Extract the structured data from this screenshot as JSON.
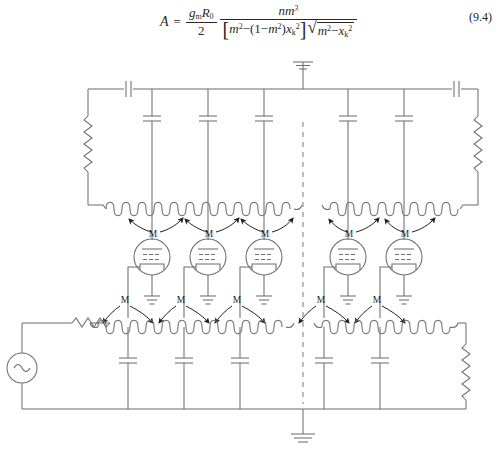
{
  "equation": {
    "lhs": "A",
    "equals": "=",
    "prefactor": {
      "numerator": "g<sub>m</sub>R<sub>0</sub>",
      "denominator": "2",
      "num_plain": "gmR0",
      "den_plain": "2"
    },
    "main_numerator": "nm³",
    "main_denominator_bracket": "[ m² − (1 − m²)xₖ² ]",
    "main_denominator_radical": "√( m² − xₖ² )",
    "number": "(9.4)",
    "parts": {
      "g": "g",
      "g_sub": "m",
      "R": "R",
      "R_sub": "0",
      "two": "2",
      "n": "n",
      "m": "m",
      "m_sup": "3",
      "bracket_open": "[",
      "bracket_close": "]",
      "m1": "m",
      "m1_sup": "2",
      "minus": "−",
      "paren_open": "(",
      "one": "1",
      "minus2": "−",
      "m2": "m",
      "m2_sup": "2",
      "paren_close": ")",
      "x": "x",
      "x_sub": "k",
      "x_sup": "2",
      "radical": "√",
      "m3": "m",
      "m3_sup": "2",
      "minus3": "−",
      "x2": "x",
      "x2_sub": "k",
      "x2_sup": "2"
    }
  },
  "circuit": {
    "title": "distributed-amplifier travelling-wave circuit",
    "labels": {
      "mutual_inductance": "M"
    },
    "mutual_coupling_labels": [
      "M",
      "M",
      "M",
      "M",
      "M",
      "M",
      "M",
      "M",
      "M",
      "M"
    ],
    "components": {
      "ac_source_symbol": "∼",
      "ground_symbol": "ground",
      "tube_count": 5,
      "top_line_capacitors": 2,
      "top_shunt_capacitors": 5,
      "bottom_shunt_capacitors": 5,
      "terminating_resistors": 4,
      "coils": 4
    },
    "colors": {
      "wire": "#6f6d6e",
      "divider": "#8d8b8c",
      "label": "#231f20"
    }
  }
}
